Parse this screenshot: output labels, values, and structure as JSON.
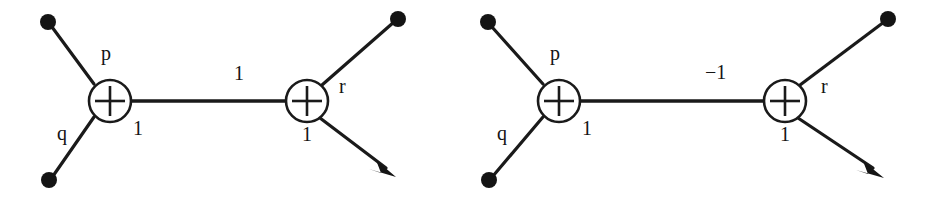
{
  "figure": {
    "background_color": "#ffffff",
    "ink_color": "#141414",
    "diagram_count": 2
  },
  "diagrams": [
    {
      "id": "left",
      "name": "signal-flow-graph-left",
      "nodes": [
        {
          "id": "adder-left",
          "symbol": "+",
          "kind": "summing-junction"
        },
        {
          "id": "adder-right",
          "symbol": "+",
          "kind": "summing-junction"
        }
      ],
      "terminals": [
        {
          "id": "terminal-top-left",
          "kind": "filled-dot"
        },
        {
          "id": "terminal-bottom-left",
          "kind": "filled-dot"
        },
        {
          "id": "terminal-top-right",
          "kind": "filled-dot"
        },
        {
          "id": "terminal-arrow-bottom",
          "kind": "arrow-head"
        }
      ],
      "labels": {
        "branch_p": "p",
        "branch_q": "q",
        "gain_left_out": "1",
        "gain_middle": "1",
        "branch_r": "r",
        "gain_right_out": "1"
      }
    },
    {
      "id": "right",
      "name": "signal-flow-graph-right",
      "nodes": [
        {
          "id": "adder-left",
          "symbol": "+",
          "kind": "summing-junction"
        },
        {
          "id": "adder-right",
          "symbol": "+",
          "kind": "summing-junction"
        }
      ],
      "terminals": [
        {
          "id": "terminal-top-left",
          "kind": "filled-dot"
        },
        {
          "id": "terminal-bottom-left",
          "kind": "filled-dot"
        },
        {
          "id": "terminal-top-right",
          "kind": "filled-dot"
        },
        {
          "id": "terminal-arrow-bottom",
          "kind": "arrow-head"
        }
      ],
      "labels": {
        "branch_p": "p",
        "branch_q": "q",
        "gain_left_out": "1",
        "gain_middle": "−1",
        "branch_r": "r",
        "gain_right_out": "1"
      }
    }
  ]
}
